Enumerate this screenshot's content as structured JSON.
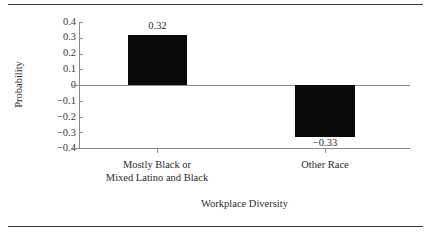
{
  "chart_data": {
    "type": "bar",
    "title": "",
    "subtitle": "",
    "categories": [
      "Mostly Black or Mixed Latino and Black",
      "Other Race"
    ],
    "category_lines": [
      [
        "Mostly Black or",
        "Mixed Latino and Black"
      ],
      [
        "Other Race"
      ]
    ],
    "values": [
      0.32,
      -0.33
    ],
    "data_labels": [
      "0.32",
      "−0.33"
    ],
    "xlabel": "Workplace Diversity",
    "ylabel": "Probability",
    "ylim": [
      -0.4,
      0.4
    ],
    "yticks": [
      0.4,
      0.3,
      0.2,
      0.1,
      0,
      -0.1,
      -0.2,
      -0.3,
      -0.4
    ],
    "ytick_labels": [
      "0.4",
      "0.3",
      "0.2",
      "0.1",
      "0",
      "−0.1",
      "−0.2",
      "−0.3",
      "−0.4"
    ],
    "grid": false,
    "legend": null,
    "bar_color": "#0a0a0a",
    "axis_color": "#8a8a8a",
    "rule_color": "#3a3a3a",
    "zero_line": 0
  },
  "figure": {
    "top_rule": "",
    "bottom_rule": ""
  }
}
